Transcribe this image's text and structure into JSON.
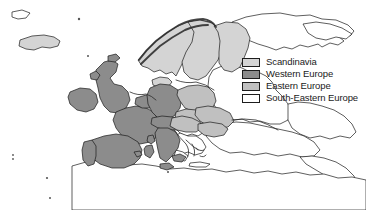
{
  "figure": {
    "type": "choropleth-map",
    "region": "Europe",
    "background_color": "#ffffff",
    "outline_color": "#1a1a1a"
  },
  "legend": {
    "name": "map-legend",
    "position": "top-right",
    "items": [
      {
        "label": "Scandinavia",
        "color": "#d4d4d4",
        "border": "#1d1d1d"
      },
      {
        "label": "Western Europe",
        "color": "#8c8c8c",
        "border": "#1d1d1d"
      },
      {
        "label": "Eastern Europe",
        "color": "#c0c0c0",
        "border": "#1d1d1d"
      },
      {
        "label": "South-Eastern Europe",
        "color": "#ffffff",
        "border": "#1d1d1d"
      }
    ]
  },
  "map_regions": {
    "scandinavia": {
      "fill": "#d4d4d4",
      "members": [
        "Iceland",
        "Norway",
        "Sweden",
        "Finland",
        "Denmark"
      ]
    },
    "western_europe": {
      "fill": "#8c8c8c",
      "members": [
        "Ireland",
        "United Kingdom",
        "France",
        "Spain",
        "Portugal",
        "Belgium",
        "Netherlands",
        "Germany",
        "Switzerland",
        "Austria",
        "Italy"
      ]
    },
    "eastern_europe": {
      "fill": "#c0c0c0",
      "members": [
        "Poland",
        "Czech Republic",
        "Slovakia",
        "Hungary",
        "Romania",
        "Bulgaria",
        "Slovenia",
        "Croatia"
      ]
    },
    "south_eastern_europe": {
      "fill": "#ffffff",
      "members": [
        "Greece",
        "Turkey",
        "Serbia",
        "Bosnia",
        "Albania",
        "Macedonia"
      ]
    },
    "unclassified": {
      "fill": "#ffffff",
      "members": [
        "Russia",
        "Belarus",
        "Ukraine",
        "Baltic states",
        "North Africa",
        "Middle East"
      ]
    }
  }
}
